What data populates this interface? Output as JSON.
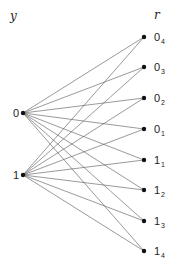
{
  "diagram": {
    "type": "bipartite-graph",
    "left_axis_label": "y",
    "right_axis_label": "r",
    "left_nodes": [
      {
        "id": "0",
        "label": "0",
        "x": 23,
        "y": 113
      },
      {
        "id": "1",
        "label": "1",
        "x": 23,
        "y": 175
      }
    ],
    "right_nodes": [
      {
        "id": "0_4",
        "base": "0",
        "sub": "4",
        "x": 144,
        "y": 37
      },
      {
        "id": "0_3",
        "base": "0",
        "sub": "3",
        "x": 144,
        "y": 67
      },
      {
        "id": "0_2",
        "base": "0",
        "sub": "2",
        "x": 144,
        "y": 98
      },
      {
        "id": "0_1",
        "base": "0",
        "sub": "1",
        "x": 144,
        "y": 129
      },
      {
        "id": "1_1",
        "base": "1",
        "sub": "1",
        "x": 144,
        "y": 160
      },
      {
        "id": "1_2",
        "base": "1",
        "sub": "2",
        "x": 144,
        "y": 190
      },
      {
        "id": "1_3",
        "base": "1",
        "sub": "3",
        "x": 144,
        "y": 221
      },
      {
        "id": "1_4",
        "base": "1",
        "sub": "4",
        "x": 144,
        "y": 251
      }
    ],
    "edges": "complete: every left node connects to every right node",
    "colors": {
      "edge": "#555555",
      "node": "#111111",
      "text": "#222222"
    }
  }
}
